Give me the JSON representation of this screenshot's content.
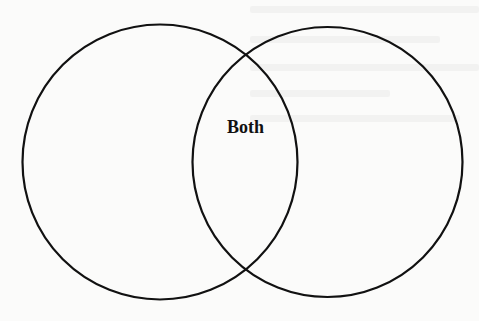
{
  "diagram": {
    "type": "venn",
    "background_color": "#fbfbfa",
    "stroke_color": "#111111",
    "circles": [
      {
        "name": "left-set",
        "cx": 160,
        "cy": 162,
        "r": 138,
        "label": ""
      },
      {
        "name": "right-set",
        "cx": 327,
        "cy": 162,
        "r": 135,
        "label": ""
      }
    ],
    "intersection_label": "Both"
  }
}
